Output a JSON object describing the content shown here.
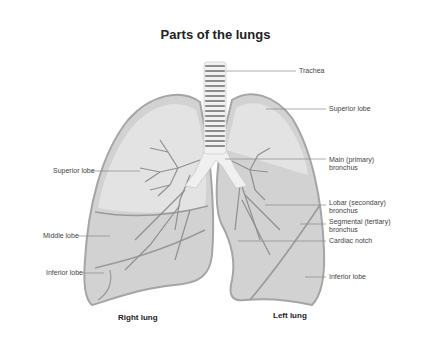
{
  "title": "Parts of the lungs",
  "colors": {
    "lung_outline": "#a9a9a9",
    "lung_fill": "#d4d4d4",
    "lobe_fill": "#e4e4e4",
    "trachea_ring": "#8c8c8c",
    "bronchus": "#f2f2f2",
    "label_line": "#888888"
  },
  "labels_right_side": [
    {
      "id": "trachea",
      "text": "Trachea"
    },
    {
      "id": "superior-lobe-left",
      "text": "Superior lobe"
    },
    {
      "id": "main-bronchus",
      "line1": "Main (primary)",
      "line2": "bronchus"
    },
    {
      "id": "lobar-bronchus",
      "line1": "Lobar (secondary)",
      "line2": "bronchus"
    },
    {
      "id": "segmental-bronchus",
      "line1": "Segmental (tertiary)",
      "line2": "bronchus"
    },
    {
      "id": "cardiac-notch",
      "text": "Cardiac notch"
    },
    {
      "id": "inferior-lobe-left",
      "text": "Inferior lobe"
    }
  ],
  "labels_left_side": [
    {
      "id": "superior-lobe-right",
      "text": "Superior lobe"
    },
    {
      "id": "middle-lobe",
      "text": "Middle lobe"
    },
    {
      "id": "inferior-lobe-right",
      "text": "Inferior lobe"
    }
  ],
  "captions": {
    "right_lung": "Right lung",
    "left_lung": "Left lung"
  }
}
